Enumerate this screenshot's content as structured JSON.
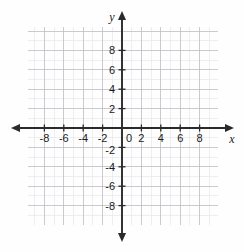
{
  "figure": {
    "kind": "cartesian-coordinate-plane",
    "background_color": "#fefefe"
  },
  "chart_data": {
    "type": "scatter",
    "title": "",
    "subtitle": "",
    "xlabel": "x",
    "ylabel": "y",
    "xlim": [
      -9.5,
      10
    ],
    "ylim": [
      -9.5,
      10
    ],
    "grid": true,
    "legend": null,
    "series": [],
    "x": [],
    "y": [],
    "annotations": [],
    "x_ticks": [
      -8,
      -6,
      -4,
      -2,
      0,
      2,
      4,
      6,
      8
    ],
    "y_ticks": [
      -8,
      -6,
      -4,
      -2,
      2,
      4,
      6,
      8
    ],
    "x_tick_labels": [
      "-8",
      "-6",
      "-4",
      "-2",
      "0",
      "2",
      "4",
      "6",
      "8"
    ],
    "y_tick_labels": [
      "-8",
      "-6",
      "-4",
      "-2",
      "2",
      "4",
      "6",
      "8"
    ],
    "origin_label": "0",
    "tick_step": 2,
    "minor_grid_step": 1
  },
  "axes": {
    "x_axis_name": "x",
    "y_axis_name": "y",
    "origin_label": "0",
    "x_labels": [
      {
        "text": "-8",
        "value": -8
      },
      {
        "text": "-6",
        "value": -6
      },
      {
        "text": "-4",
        "value": -4
      },
      {
        "text": "-2",
        "value": -2
      },
      {
        "text": "2",
        "value": 2
      },
      {
        "text": "4",
        "value": 4
      },
      {
        "text": "6",
        "value": 6
      },
      {
        "text": "8",
        "value": 8
      }
    ],
    "y_labels": [
      {
        "text": "8",
        "value": 8
      },
      {
        "text": "6",
        "value": 6
      },
      {
        "text": "4",
        "value": 4
      },
      {
        "text": "2",
        "value": 2
      },
      {
        "text": "-2",
        "value": -2
      },
      {
        "text": "-4",
        "value": -4
      },
      {
        "text": "-6",
        "value": -6
      },
      {
        "text": "-8",
        "value": -8
      }
    ]
  },
  "colors": {
    "axis": "#2a2a2a",
    "minor_grid": "#e7e7ea",
    "major_grid": "#bdbdc3",
    "tick_text": "#1a1a1a",
    "background": "#fefefe"
  },
  "geometry": {
    "origin_x": 122,
    "origin_y": 128,
    "unit_px": 9.7,
    "grid_left": 27.5,
    "grid_right": 218,
    "grid_top": 27,
    "grid_bottom": 225
  }
}
